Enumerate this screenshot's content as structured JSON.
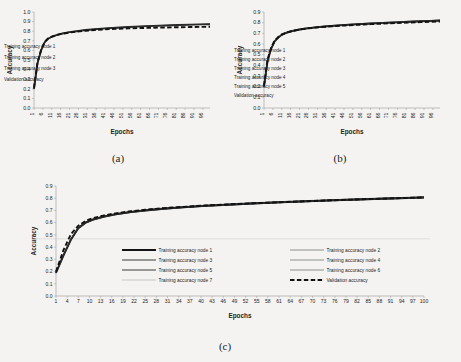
{
  "figure": {
    "background_color": "#f4f3f1",
    "ink_color": "#232323"
  },
  "panels": [
    {
      "id": "a",
      "caption": "(a)",
      "chart_data": {
        "type": "line",
        "title": "",
        "xlabel": "Epochs",
        "ylabel": "Accuracy",
        "xlim": [
          1,
          100
        ],
        "ylim": [
          0.0,
          1.0
        ],
        "grid": false,
        "legend_position": "center-right-inside",
        "xticks": [
          1,
          6,
          11,
          16,
          21,
          26,
          31,
          36,
          41,
          46,
          51,
          56,
          61,
          66,
          71,
          76,
          81,
          86,
          91,
          96
        ],
        "yticks": [
          "0.0",
          "0.1",
          "0.2",
          "0.3",
          "0.4",
          "0.5",
          "0.6",
          "0.7",
          "0.8",
          "0.9",
          "1.0"
        ],
        "x": [
          1,
          3,
          5,
          7,
          9,
          11,
          14,
          17,
          21,
          25,
          30,
          35,
          41,
          47,
          54,
          61,
          68,
          75,
          82,
          89,
          95,
          100
        ],
        "series": [
          {
            "name": "Training accuracy node 1",
            "style": "solid-thick",
            "values": [
              0.2,
              0.47,
              0.6,
              0.685,
              0.722,
              0.742,
              0.762,
              0.776,
              0.79,
              0.8,
              0.812,
              0.82,
              0.829,
              0.836,
              0.843,
              0.85,
              0.855,
              0.86,
              0.864,
              0.868,
              0.871,
              0.873
            ]
          },
          {
            "name": "Training accuracy node 2",
            "style": "solid-medium",
            "values": [
              0.195,
              0.465,
              0.598,
              0.682,
              0.72,
              0.74,
              0.76,
              0.774,
              0.788,
              0.799,
              0.811,
              0.819,
              0.828,
              0.835,
              0.842,
              0.849,
              0.854,
              0.859,
              0.863,
              0.867,
              0.87,
              0.872
            ]
          },
          {
            "name": "Training accuracy node 3",
            "style": "solid-thin",
            "values": [
              0.205,
              0.472,
              0.603,
              0.688,
              0.724,
              0.744,
              0.764,
              0.778,
              0.792,
              0.802,
              0.813,
              0.821,
              0.83,
              0.837,
              0.844,
              0.851,
              0.856,
              0.861,
              0.865,
              0.869,
              0.872,
              0.874
            ]
          },
          {
            "name": "Validation accuracy",
            "style": "dashed",
            "values": [
              0.21,
              0.48,
              0.605,
              0.69,
              0.725,
              0.743,
              0.761,
              0.774,
              0.786,
              0.795,
              0.805,
              0.812,
              0.819,
              0.824,
              0.829,
              0.833,
              0.836,
              0.839,
              0.841,
              0.843,
              0.845,
              0.846
            ]
          }
        ]
      }
    },
    {
      "id": "b",
      "caption": "(b)",
      "chart_data": {
        "type": "line",
        "title": "",
        "xlabel": "Epochs",
        "ylabel": "Accuracy",
        "xlim": [
          1,
          100
        ],
        "ylim": [
          0.0,
          0.9
        ],
        "grid": false,
        "legend_position": "center-right-inside",
        "xticks": [
          1,
          6,
          11,
          16,
          21,
          26,
          31,
          36,
          41,
          46,
          51,
          56,
          61,
          66,
          71,
          76,
          81,
          86,
          91,
          96
        ],
        "yticks": [
          "0.0",
          "0.1",
          "0.2",
          "0.3",
          "0.4",
          "0.5",
          "0.6",
          "0.7",
          "0.8",
          "0.9"
        ],
        "x": [
          1,
          3,
          5,
          7,
          9,
          11,
          14,
          17,
          21,
          25,
          30,
          35,
          41,
          47,
          54,
          61,
          68,
          75,
          82,
          89,
          95,
          100
        ],
        "series": [
          {
            "name": "Training accuracy node 1",
            "style": "solid-thick",
            "values": [
              0.2,
              0.44,
              0.555,
              0.625,
              0.66,
              0.686,
              0.708,
              0.722,
              0.736,
              0.746,
              0.756,
              0.764,
              0.772,
              0.779,
              0.786,
              0.792,
              0.798,
              0.803,
              0.808,
              0.813,
              0.817,
              0.82
            ]
          },
          {
            "name": "Training accuracy node 2",
            "style": "solid-medium",
            "values": [
              0.198,
              0.437,
              0.552,
              0.622,
              0.658,
              0.684,
              0.706,
              0.72,
              0.734,
              0.744,
              0.754,
              0.762,
              0.77,
              0.777,
              0.784,
              0.79,
              0.796,
              0.801,
              0.806,
              0.811,
              0.815,
              0.818
            ]
          },
          {
            "name": "Training accuracy node 3",
            "style": "solid-thin",
            "values": [
              0.202,
              0.443,
              0.558,
              0.628,
              0.663,
              0.688,
              0.71,
              0.724,
              0.738,
              0.748,
              0.758,
              0.766,
              0.774,
              0.781,
              0.788,
              0.794,
              0.8,
              0.805,
              0.81,
              0.815,
              0.819,
              0.822
            ]
          },
          {
            "name": "Training accuracy node 4",
            "style": "solid-thin",
            "values": [
              0.196,
              0.434,
              0.55,
              0.62,
              0.656,
              0.682,
              0.704,
              0.718,
              0.732,
              0.742,
              0.752,
              0.76,
              0.768,
              0.775,
              0.782,
              0.788,
              0.794,
              0.799,
              0.804,
              0.809,
              0.813,
              0.816
            ]
          },
          {
            "name": "Training accuracy node 5",
            "style": "solid-thin",
            "values": [
              0.204,
              0.446,
              0.56,
              0.63,
              0.665,
              0.69,
              0.712,
              0.726,
              0.74,
              0.75,
              0.76,
              0.768,
              0.776,
              0.783,
              0.79,
              0.796,
              0.802,
              0.807,
              0.812,
              0.817,
              0.821,
              0.824
            ]
          },
          {
            "name": "Validation accuracy",
            "style": "dashed",
            "values": [
              0.21,
              0.455,
              0.565,
              0.632,
              0.666,
              0.69,
              0.71,
              0.723,
              0.736,
              0.745,
              0.754,
              0.761,
              0.768,
              0.774,
              0.78,
              0.786,
              0.791,
              0.796,
              0.8,
              0.805,
              0.808,
              0.811
            ]
          }
        ]
      }
    },
    {
      "id": "c",
      "caption": "(c)",
      "chart_data": {
        "type": "line",
        "title": "",
        "xlabel": "Epochs",
        "ylabel": "Accuracy",
        "xlim": [
          1,
          100
        ],
        "ylim": [
          0.0,
          0.9
        ],
        "grid": false,
        "legend_position": "center-inside-two-columns",
        "xticks": [
          1,
          4,
          7,
          10,
          13,
          16,
          19,
          22,
          25,
          28,
          31,
          34,
          37,
          40,
          43,
          46,
          49,
          52,
          55,
          58,
          61,
          64,
          67,
          70,
          73,
          76,
          79,
          82,
          85,
          88,
          91,
          94,
          97,
          100
        ],
        "yticks": [
          "0.0",
          "0.1",
          "0.2",
          "0.3",
          "0.4",
          "0.5",
          "0.6",
          "0.7",
          "0.8",
          "0.9"
        ],
        "x": [
          1,
          3,
          5,
          7,
          9,
          11,
          14,
          17,
          21,
          25,
          30,
          35,
          41,
          47,
          54,
          61,
          68,
          75,
          82,
          89,
          95,
          100
        ],
        "series": [
          {
            "name": "Training accuracy node 1",
            "style": "solid-thick",
            "values": [
              0.19,
              0.33,
              0.46,
              0.555,
              0.6,
              0.625,
              0.65,
              0.668,
              0.686,
              0.7,
              0.714,
              0.725,
              0.737,
              0.746,
              0.757,
              0.766,
              0.774,
              0.782,
              0.789,
              0.796,
              0.801,
              0.806
            ]
          },
          {
            "name": "Training accuracy node 2",
            "style": "solid-thin",
            "values": [
              0.188,
              0.328,
              0.457,
              0.552,
              0.598,
              0.623,
              0.648,
              0.666,
              0.684,
              0.698,
              0.712,
              0.723,
              0.735,
              0.744,
              0.755,
              0.764,
              0.772,
              0.78,
              0.787,
              0.794,
              0.799,
              0.804
            ]
          },
          {
            "name": "Training accuracy node 3",
            "style": "solid-medium",
            "values": [
              0.192,
              0.334,
              0.463,
              0.558,
              0.603,
              0.628,
              0.653,
              0.67,
              0.688,
              0.702,
              0.716,
              0.727,
              0.739,
              0.748,
              0.759,
              0.768,
              0.776,
              0.784,
              0.791,
              0.798,
              0.803,
              0.808
            ]
          },
          {
            "name": "Training accuracy node 4",
            "style": "solid-thin",
            "values": [
              0.186,
              0.325,
              0.455,
              0.55,
              0.596,
              0.621,
              0.646,
              0.664,
              0.682,
              0.696,
              0.71,
              0.721,
              0.733,
              0.742,
              0.753,
              0.762,
              0.77,
              0.778,
              0.785,
              0.792,
              0.797,
              0.802
            ]
          },
          {
            "name": "Training accuracy node 5",
            "style": "solid-medium",
            "values": [
              0.194,
              0.337,
              0.466,
              0.56,
              0.605,
              0.63,
              0.655,
              0.672,
              0.69,
              0.704,
              0.718,
              0.729,
              0.741,
              0.75,
              0.761,
              0.77,
              0.778,
              0.786,
              0.793,
              0.8,
              0.805,
              0.81
            ]
          },
          {
            "name": "Training accuracy node 6",
            "style": "solid-thin",
            "values": [
              0.19,
              0.33,
              0.459,
              0.554,
              0.599,
              0.624,
              0.649,
              0.667,
              0.685,
              0.699,
              0.713,
              0.724,
              0.736,
              0.745,
              0.756,
              0.765,
              0.773,
              0.781,
              0.788,
              0.795,
              0.8,
              0.805
            ]
          },
          {
            "name": "Training accuracy node 7",
            "style": "solid-thin-light",
            "values": [
              0.196,
              0.34,
              0.468,
              0.562,
              0.607,
              0.632,
              0.657,
              0.674,
              0.692,
              0.706,
              0.72,
              0.731,
              0.743,
              0.752,
              0.763,
              0.772,
              0.78,
              0.788,
              0.795,
              0.802,
              0.807,
              0.812
            ]
          },
          {
            "name": "Validation accuracy",
            "style": "dashed",
            "values": [
              0.2,
              0.375,
              0.505,
              0.575,
              0.615,
              0.638,
              0.66,
              0.676,
              0.693,
              0.706,
              0.719,
              0.729,
              0.74,
              0.749,
              0.759,
              0.767,
              0.775,
              0.783,
              0.79,
              0.797,
              0.802,
              0.807
            ]
          }
        ]
      }
    }
  ]
}
